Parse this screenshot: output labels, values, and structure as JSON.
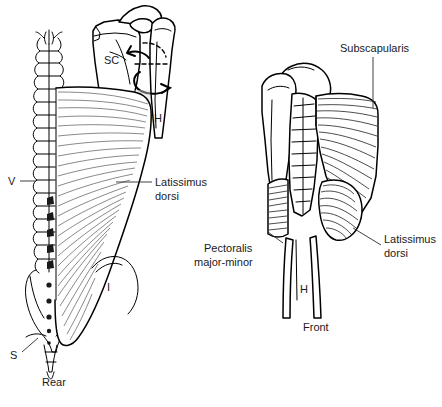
{
  "figure": {
    "title_alt": "Latissimus dorsi and subscapularis anatomical illustration",
    "background_color": "#ffffff",
    "ink_color": "#000000",
    "shade_color": "#d9d9d9"
  },
  "panels": [
    {
      "id": "rear",
      "caption": "Rear",
      "labels": [
        {
          "key": "latissimus_dorsi",
          "text_line1": "Latissimus",
          "text_line2": "dorsi",
          "leader": "horizontal"
        },
        {
          "key": "vertebrae",
          "text": "V",
          "leader": "horizontal"
        },
        {
          "key": "sacrum",
          "text": "S",
          "leader": "diagonal"
        },
        {
          "key": "scapula",
          "text": "SC",
          "leader": "none"
        },
        {
          "key": "humerus",
          "text": "H",
          "leader": "none"
        },
        {
          "key": "ilium",
          "text": "I",
          "leader": "none"
        }
      ]
    },
    {
      "id": "front",
      "caption": "Front",
      "labels": [
        {
          "key": "subscapularis",
          "text": "Subscapularis",
          "leader": "vertical"
        },
        {
          "key": "pectoralis",
          "text_line1": "Pectoralis",
          "text_line2": "major-minor",
          "leader": "diagonal"
        },
        {
          "key": "latissimus_dorsi",
          "text_line1": "Latissimus",
          "text_line2": "dorsi",
          "leader": "diagonal"
        },
        {
          "key": "humerus",
          "text": "H",
          "leader": "none"
        }
      ]
    }
  ],
  "text": {
    "rear_caption": "Rear",
    "front_caption": "Front",
    "latissimus_line1": "Latissimus",
    "latissimus_line2": "dorsi",
    "latissimus_front_line1": "Latissimus",
    "latissimus_front_line2": "dorsi",
    "subscapularis": "Subscapularis",
    "pectoralis_line1": "Pectoralis",
    "pectoralis_line2": "major-minor",
    "letter_v": "V",
    "letter_s": "S",
    "letter_sc": "SC",
    "letter_h_rear": "H",
    "letter_h_front": "H",
    "letter_i": "I"
  }
}
